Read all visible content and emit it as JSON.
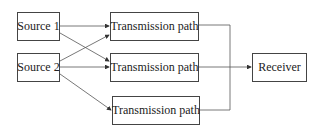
{
  "diagram": {
    "nodes": {
      "source1": {
        "label": "Source 1"
      },
      "source2": {
        "label": "Source 2"
      },
      "path1": {
        "label": "Transmission path"
      },
      "path2": {
        "label": "Transmission path"
      },
      "path3": {
        "label": "Transmission path"
      },
      "receiver": {
        "label": "Receiver"
      }
    },
    "edges": [
      {
        "from": "Source 1",
        "to": "Transmission path (top)"
      },
      {
        "from": "Source 1",
        "to": "Transmission path (middle)"
      },
      {
        "from": "Source 2",
        "to": "Transmission path (top)"
      },
      {
        "from": "Source 2",
        "to": "Transmission path (middle)"
      },
      {
        "from": "Source 2",
        "to": "Transmission path (bottom)"
      },
      {
        "from": "Transmission paths (all)",
        "to": "Receiver"
      }
    ],
    "colors": {
      "line": "#444444",
      "text": "#222222",
      "background": "#ffffff"
    }
  }
}
